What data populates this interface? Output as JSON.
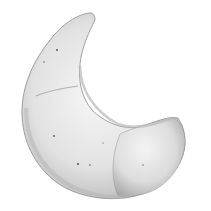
{
  "image": {
    "subject": "crescent-shaped specimen illustration",
    "style": "grayscale stippled drawing",
    "colors": {
      "background": "#ffffff",
      "body_light": "#f2f2f2",
      "body_mid": "#d8d8d8",
      "body_shadow": "#a9a9a9",
      "outline": "#8c8c8c",
      "dots": "#555555"
    }
  }
}
